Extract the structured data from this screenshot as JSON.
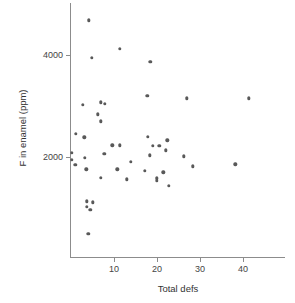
{
  "chart_data": {
    "type": "scatter",
    "title": "",
    "xlabel": "Total defs",
    "ylabel": "F in enamel (ppm)",
    "xlim": [
      0,
      50
    ],
    "ylim": [
      0,
      5000
    ],
    "xticks": [
      10,
      20,
      30,
      40
    ],
    "yticks": [
      2000,
      4000
    ],
    "grid": false,
    "legend": null,
    "marker": "filled-circle",
    "marker_color": "#595959",
    "axis_color": "#8c8c8c",
    "points": [
      {
        "x": 4.2,
        "y": 4680
      },
      {
        "x": 11.3,
        "y": 4120
      },
      {
        "x": 4.9,
        "y": 3940
      },
      {
        "x": 18.4,
        "y": 3870
      },
      {
        "x": 17.7,
        "y": 3200
      },
      {
        "x": 26.9,
        "y": 3150
      },
      {
        "x": 41.3,
        "y": 3150
      },
      {
        "x": 6.9,
        "y": 3070
      },
      {
        "x": 7.9,
        "y": 3040
      },
      {
        "x": 2.8,
        "y": 3020
      },
      {
        "x": 6.3,
        "y": 2840
      },
      {
        "x": 6.9,
        "y": 2700
      },
      {
        "x": 1.1,
        "y": 2450
      },
      {
        "x": 17.8,
        "y": 2400
      },
      {
        "x": 3.1,
        "y": 2390
      },
      {
        "x": 22.4,
        "y": 2330
      },
      {
        "x": 9.6,
        "y": 2230
      },
      {
        "x": 11.4,
        "y": 2230
      },
      {
        "x": 19.0,
        "y": 2220
      },
      {
        "x": 20.5,
        "y": 2220
      },
      {
        "x": 22.0,
        "y": 2130
      },
      {
        "x": 0.2,
        "y": 2080
      },
      {
        "x": 7.7,
        "y": 2060
      },
      {
        "x": 18.3,
        "y": 2030
      },
      {
        "x": 26.3,
        "y": 2010
      },
      {
        "x": 3.2,
        "y": 1990
      },
      {
        "x": 0.2,
        "y": 1940
      },
      {
        "x": 13.9,
        "y": 1900
      },
      {
        "x": 1.0,
        "y": 1850
      },
      {
        "x": 38.2,
        "y": 1860
      },
      {
        "x": 28.3,
        "y": 1820
      },
      {
        "x": 3.6,
        "y": 1760
      },
      {
        "x": 10.8,
        "y": 1760
      },
      {
        "x": 17.2,
        "y": 1730
      },
      {
        "x": 21.5,
        "y": 1700
      },
      {
        "x": 6.9,
        "y": 1590
      },
      {
        "x": 13.0,
        "y": 1560
      },
      {
        "x": 19.9,
        "y": 1580
      },
      {
        "x": 20.0,
        "y": 1530
      },
      {
        "x": 22.8,
        "y": 1430
      },
      {
        "x": 3.7,
        "y": 1130
      },
      {
        "x": 5.0,
        "y": 1110
      },
      {
        "x": 3.7,
        "y": 1020
      },
      {
        "x": 4.5,
        "y": 970
      },
      {
        "x": 4.0,
        "y": 490
      }
    ]
  }
}
